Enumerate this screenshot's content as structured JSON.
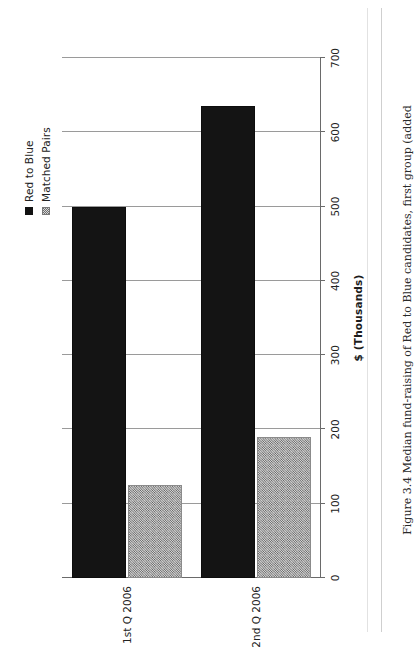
{
  "document": {
    "caption": "Figure 3.4  Median fund-raising of Red to Blue candidates, first group (added"
  },
  "chart_data": {
    "type": "bar",
    "orientation": "horizontal",
    "title": "",
    "xlabel": "$ (Thousands)",
    "ylabel": "",
    "categories": [
      "1st Q 2006",
      "2nd Q 2006"
    ],
    "series": [
      {
        "name": "Red to Blue",
        "values": [
          500,
          635
        ],
        "color": "#141414",
        "fill": "solid"
      },
      {
        "name": "Matched Pairs",
        "values": [
          125,
          190
        ],
        "color": "#d5d5d5",
        "fill": "hatch"
      }
    ],
    "xlim": [
      0,
      700
    ],
    "xticks": [
      0,
      100,
      200,
      300,
      400,
      500,
      600,
      700
    ],
    "xtick_labels": [
      "0",
      "100",
      "200",
      "300",
      "400",
      "500",
      "600",
      "700"
    ],
    "grid": true,
    "legend_position": "top-right",
    "legend_entries": [
      "Red to Blue",
      "Matched Pairs"
    ]
  }
}
